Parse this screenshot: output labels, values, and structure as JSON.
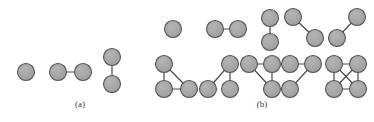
{
  "figure": {
    "type": "graph-theory-diagram",
    "background_color": "#ffffff",
    "node": {
      "radius": 8.5,
      "fill_color": "#a6a6a6",
      "stroke_color": "#555555",
      "stroke_width": 1.1
    },
    "edge": {
      "stroke_color": "#4a4a4a",
      "stroke_width": 1.2
    }
  },
  "panels": [
    {
      "id": "panel-a",
      "caption": "(a)",
      "caption_x": 80,
      "caption_y": 106,
      "node_count": 2,
      "graphs": [
        {
          "id": "a-1",
          "name": "two-isolated-vertices-partial",
          "nodes": [
            {
              "id": "n0",
              "x": 26,
              "y": 72
            }
          ],
          "edges": []
        },
        {
          "id": "a-2",
          "name": "single-edge-horizontal",
          "nodes": [
            {
              "id": "n0",
              "x": 58,
              "y": 72
            },
            {
              "id": "n1",
              "x": 83,
              "y": 72
            }
          ],
          "edges": [
            {
              "from": "n0",
              "to": "n1"
            }
          ]
        },
        {
          "id": "a-3",
          "name": "single-edge-vertical",
          "nodes": [
            {
              "id": "n0",
              "x": 112,
              "y": 57
            },
            {
              "id": "n1",
              "x": 112,
              "y": 84
            }
          ],
          "edges": [
            {
              "from": "n0",
              "to": "n1"
            }
          ]
        }
      ]
    },
    {
      "id": "panel-b",
      "caption": "(b)",
      "caption_x": 263,
      "caption_y": 106,
      "node_count": 4,
      "graphs": [
        {
          "id": "b-1",
          "name": "empty-graph-single-node",
          "nodes": [
            {
              "id": "n0",
              "x": 173,
              "y": 29
            }
          ],
          "edges": []
        },
        {
          "id": "b-2",
          "name": "one-edge-horizontal",
          "nodes": [
            {
              "id": "n0",
              "x": 215,
              "y": 29
            },
            {
              "id": "n1",
              "x": 238,
              "y": 29
            }
          ],
          "edges": [
            {
              "from": "n0",
              "to": "n1"
            }
          ]
        },
        {
          "id": "b-3",
          "name": "one-edge-vertical",
          "nodes": [
            {
              "id": "n0",
              "x": 270,
              "y": 18
            },
            {
              "id": "n1",
              "x": 270,
              "y": 42
            }
          ],
          "edges": [
            {
              "from": "n0",
              "to": "n1"
            }
          ]
        },
        {
          "id": "b-4",
          "name": "path-two-edges-left",
          "nodes": [
            {
              "id": "n0",
              "x": 293,
              "y": 17
            },
            {
              "id": "n1",
              "x": 315,
              "y": 38
            }
          ],
          "edges": [
            {
              "from": "n0",
              "to": "n1"
            }
          ]
        },
        {
          "id": "b-5",
          "name": "path-two-edges-right",
          "nodes": [
            {
              "id": "n0",
              "x": 357,
              "y": 17
            },
            {
              "id": "n1",
              "x": 337,
              "y": 38
            }
          ],
          "edges": [
            {
              "from": "n0",
              "to": "n1"
            }
          ]
        },
        {
          "id": "b-6",
          "name": "triangle-with-pendant-left",
          "nodes": [
            {
              "id": "n0",
              "x": 164,
              "y": 64
            },
            {
              "id": "n1",
              "x": 164,
              "y": 89
            },
            {
              "id": "n2",
              "x": 189,
              "y": 89
            }
          ],
          "edges": [
            {
              "from": "n0",
              "to": "n1"
            },
            {
              "from": "n0",
              "to": "n2"
            },
            {
              "from": "n1",
              "to": "n2"
            }
          ]
        },
        {
          "id": "b-7",
          "name": "path-three-nodes",
          "nodes": [
            {
              "id": "n0",
              "x": 230,
              "y": 64
            },
            {
              "id": "n1",
              "x": 208,
              "y": 89
            },
            {
              "id": "n2",
              "x": 230,
              "y": 89
            }
          ],
          "edges": [
            {
              "from": "n0",
              "to": "n1"
            },
            {
              "from": "n0",
              "to": "n2"
            }
          ]
        },
        {
          "id": "b-8",
          "name": "star-three-edges",
          "nodes": [
            {
              "id": "n0",
              "x": 249,
              "y": 64
            },
            {
              "id": "n1",
              "x": 272,
              "y": 64
            },
            {
              "id": "n2",
              "x": 272,
              "y": 89
            }
          ],
          "edges": [
            {
              "from": "n0",
              "to": "n1"
            },
            {
              "from": "n1",
              "to": "n2"
            },
            {
              "from": "n0",
              "to": "n2"
            }
          ]
        },
        {
          "id": "b-9",
          "name": "path-four-nodes",
          "nodes": [
            {
              "id": "n0",
              "x": 290,
              "y": 64
            },
            {
              "id": "n1",
              "x": 313,
              "y": 64
            },
            {
              "id": "n2",
              "x": 290,
              "y": 89
            }
          ],
          "edges": [
            {
              "from": "n0",
              "to": "n1"
            },
            {
              "from": "n1",
              "to": "n2"
            }
          ]
        },
        {
          "id": "b-10",
          "name": "complete-graph-k4",
          "nodes": [
            {
              "id": "n0",
              "x": 334,
              "y": 64
            },
            {
              "id": "n1",
              "x": 358,
              "y": 64
            },
            {
              "id": "n2",
              "x": 334,
              "y": 89
            },
            {
              "id": "n3",
              "x": 358,
              "y": 89
            }
          ],
          "edges": [
            {
              "from": "n0",
              "to": "n1"
            },
            {
              "from": "n0",
              "to": "n2"
            },
            {
              "from": "n1",
              "to": "n3"
            },
            {
              "from": "n2",
              "to": "n3"
            },
            {
              "from": "n0",
              "to": "n3"
            },
            {
              "from": "n1",
              "to": "n2"
            }
          ]
        }
      ]
    }
  ]
}
